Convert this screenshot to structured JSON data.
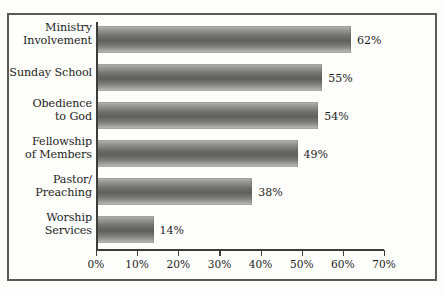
{
  "chart_data": {
    "type": "bar",
    "orientation": "horizontal",
    "title": "",
    "subtitle": "",
    "xlabel": "",
    "ylabel": "",
    "categories": [
      "Ministry\nInvolvement",
      "Sunday School",
      "Obedience\nto God",
      "Fellowship\nof Members",
      "Pastor/\nPreaching",
      "Worship\nServices"
    ],
    "values": [
      62,
      55,
      54,
      49,
      38,
      14
    ],
    "value_labels": [
      "62%",
      "55%",
      "54%",
      "49%",
      "38%",
      "14%"
    ],
    "xlim": [
      0,
      70
    ],
    "xticks": [
      0,
      10,
      20,
      30,
      40,
      50,
      60,
      70
    ],
    "xtick_labels": [
      "0%",
      "10%",
      "20%",
      "30%",
      "40%",
      "50%",
      "60%",
      "70%"
    ],
    "grid": false,
    "legend": null,
    "bar_fill": "#6e6e6b",
    "axis_color": "#3c3c3a",
    "frame_color": "#5a5a58",
    "background": "#fefefd"
  },
  "categories": [
    {
      "line1": "Ministry",
      "line2": "Involvement"
    },
    {
      "line1": "Sunday School",
      "line2": ""
    },
    {
      "line1": "Obedience",
      "line2": "to God"
    },
    {
      "line1": "Fellowship",
      "line2": "of Members"
    },
    {
      "line1": "Pastor/",
      "line2": "Preaching"
    },
    {
      "line1": "Worship",
      "line2": "Services"
    }
  ],
  "bars": [
    {
      "label": "62%"
    },
    {
      "label": "55%"
    },
    {
      "label": "54%"
    },
    {
      "label": "49%"
    },
    {
      "label": "38%"
    },
    {
      "label": "14%"
    }
  ],
  "xaxis": {
    "labels": [
      "0%",
      "10%",
      "20%",
      "30%",
      "40%",
      "50%",
      "60%",
      "70%"
    ]
  }
}
